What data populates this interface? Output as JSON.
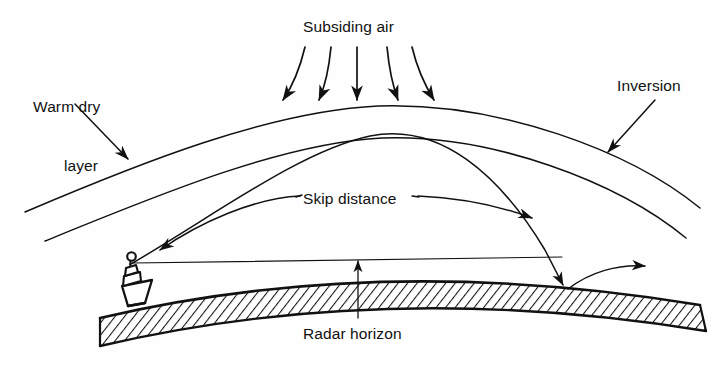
{
  "figure": {
    "kind": "radar-ducting-diagram",
    "title_visible": false,
    "background_color": "#fefefe",
    "ink_color": "#111111",
    "width": 726,
    "height": 369
  },
  "labels": {
    "subsiding_air": "Subsiding air",
    "warm_dry_line1": "Warm dry",
    "warm_dry_line2": "layer",
    "inversion": "Inversion",
    "skip_distance": "Skip distance",
    "radar_horizon": "Radar horizon"
  },
  "elements": {
    "inversion_top_arc": "inversion-top-boundary-arc",
    "inversion_bottom_arc": "inversion-bottom-boundary-arc",
    "earth_surface": "curved-earth-surface-hatched",
    "ship": "ship-with-radar-antenna",
    "radar_antenna": "radar-antenna-circle",
    "line_of_sight": "straight-line-of-sight-to-horizon",
    "trapped_ray": "refracted-radar-ray-skipping-over-inversion",
    "reflected_ray": "reflected-ray-leaving-surface",
    "subsiding_air_arrows": 5,
    "leader_arrow_warm_dry": "leader-arrow-to-warm-dry-layer",
    "leader_arrow_inversion": "leader-arrow-to-inversion",
    "leader_arrow_skip_left": "leader-arrow-to-ship",
    "leader_arrow_skip_right": "leader-arrow-to-landing-point",
    "leader_line_radar_horizon": "leader-line-to-radar-horizon"
  },
  "geometry": {
    "inversion_top_arc_path": "M 25 212 Q 370 104 700 208",
    "inversion_bottom_arc_path": "M 45 241 Q 372 136 686 238",
    "earth_top_path": "M 100 318 Q 380 252 700 305",
    "earth_bottom_path": "M 100 345 Q 385 278 706 330",
    "ray_path": "M 131 264 Q 345 120 565 288",
    "line_of_sight": "M 131 263 L 560 258",
    "ship_position": [
      131,
      264
    ],
    "ray_landing_point": [
      565,
      288
    ]
  }
}
